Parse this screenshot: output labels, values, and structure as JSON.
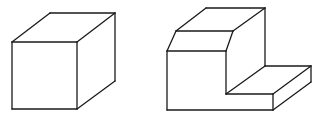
{
  "figure": {
    "background": "#ffffff",
    "stroke_color": "#1a1a1a",
    "shapes": [
      {
        "name": "cube",
        "lines": [
          [
            12,
            42,
            77,
            42
          ],
          [
            77,
            42,
            77,
            109
          ],
          [
            77,
            109,
            12,
            109
          ],
          [
            12,
            109,
            12,
            42
          ],
          [
            12,
            42,
            50,
            13
          ],
          [
            50,
            13,
            115,
            13
          ],
          [
            115,
            13,
            77,
            42
          ],
          [
            115,
            13,
            115,
            81
          ],
          [
            115,
            81,
            77,
            109
          ]
        ]
      },
      {
        "name": "stepped-block",
        "lines": [
          [
            206,
            8,
            265,
            8
          ],
          [
            206,
            8,
            176,
            31
          ],
          [
            265,
            8,
            233,
            31
          ],
          [
            176,
            31,
            233,
            31
          ],
          [
            176,
            31,
            167,
            51
          ],
          [
            233,
            31,
            226,
            51
          ],
          [
            167,
            51,
            226,
            51
          ],
          [
            167,
            51,
            167,
            110
          ],
          [
            167,
            110,
            273,
            110
          ],
          [
            226,
            51,
            226,
            94
          ],
          [
            265,
            8,
            265,
            66
          ],
          [
            226,
            94,
            265,
            66
          ],
          [
            265,
            66,
            311,
            66
          ],
          [
            311,
            66,
            311,
            82
          ],
          [
            226,
            94,
            273,
            94
          ],
          [
            273,
            94,
            273,
            110
          ],
          [
            273,
            94,
            311,
            66
          ],
          [
            273,
            110,
            311,
            82
          ]
        ]
      }
    ]
  }
}
